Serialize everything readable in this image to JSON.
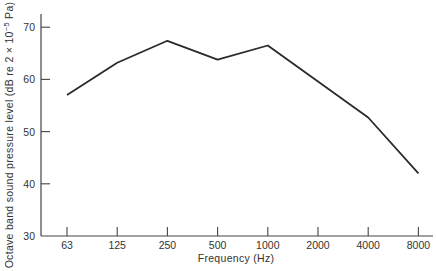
{
  "chart_data": {
    "type": "line",
    "title": "",
    "xlabel": "Frequency (Hz)",
    "ylabel_parts": {
      "main": "Octave band sound pressure level (dB re 2 × 10",
      "sup": "−5",
      "tail": " Pa)"
    },
    "ylabel": "Octave band sound pressure level (dB re 2 × 10⁻⁵ Pa)",
    "categories": [
      "63",
      "125",
      "250",
      "500",
      "1000",
      "2000",
      "4000",
      "8000"
    ],
    "values": [
      57,
      63.2,
      67.4,
      63.8,
      66.5,
      59.6,
      52.7,
      42
    ],
    "yticks": [
      "30",
      "40",
      "50",
      "60",
      "70"
    ],
    "ylim": [
      30,
      72
    ],
    "grid": false,
    "legend": "none",
    "line_color": "#2a2a2a"
  }
}
